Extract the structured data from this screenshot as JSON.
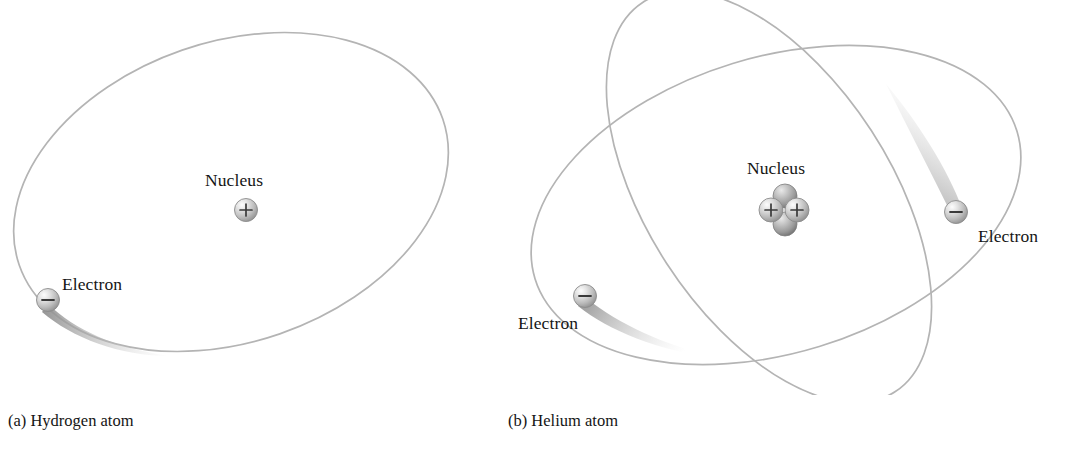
{
  "figure": {
    "type": "scientific-diagram",
    "background_color": "#ffffff",
    "orbit_color": "#b4b4b4",
    "label_color": "#151515",
    "particle_body_color": "#c9c9c9",
    "particle_outline_color": "#8c8c8c",
    "sign_color": "#3a3a3a",
    "trail_color": "#a8a8a8"
  },
  "panels": [
    {
      "id": "hydrogen",
      "caption": "(a) Hydrogen atom",
      "nucleus_label": "Nucleus",
      "electron_labels": [
        "Electron"
      ],
      "orbit_count": 1,
      "proton_count": 1,
      "neutron_count": 0,
      "electron_count": 1,
      "proton_sign": "+",
      "electron_sign": "−"
    },
    {
      "id": "helium",
      "caption": "(b) Helium atom",
      "nucleus_label": "Nucleus",
      "electron_labels": [
        "Electron",
        "Electron"
      ],
      "orbit_count": 2,
      "proton_count": 2,
      "neutron_count": 2,
      "electron_count": 2,
      "proton_sign": "+",
      "electron_sign": "−"
    }
  ]
}
